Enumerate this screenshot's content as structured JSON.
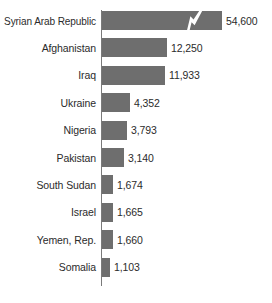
{
  "chart_data": {
    "type": "bar",
    "orientation": "horizontal",
    "title": "",
    "subtitle": "",
    "xlabel": "",
    "ylabel": "",
    "grid": false,
    "legend": null,
    "axis_break": {
      "present": true,
      "series_index": 0,
      "note": "zig-zag break mark on the Syrian Arab Republic bar indicating a truncated scale"
    },
    "bar_color": "#6e6e6e",
    "axis_color": "#7a7a7a",
    "text_color": "#2b2b2b",
    "background_color": "#ffffff",
    "categories": [
      "Syrian Arab Republic",
      "Afghanistan",
      "Iraq",
      "Ukraine",
      "Nigeria",
      "Pakistan",
      "South Sudan",
      "Israel",
      "Yemen, Rep.",
      "Somalia"
    ],
    "values": [
      54600,
      12250,
      11933,
      4352,
      3793,
      3140,
      1674,
      1665,
      1660,
      1103
    ],
    "value_labels": [
      "54,600",
      "12,250",
      "11,933",
      "4,352",
      "3,793",
      "3,140",
      "1,674",
      "1,665",
      "1,660",
      "1,103"
    ],
    "bar_pixel_lengths": [
      120,
      65,
      63,
      28,
      25,
      22,
      11,
      11,
      11,
      8
    ]
  },
  "rows": [
    {
      "label": "Syrian Arab Republic",
      "value_label": "54,600",
      "bar_px": 120,
      "break": true
    },
    {
      "label": "Afghanistan",
      "value_label": "12,250",
      "bar_px": 65,
      "break": false
    },
    {
      "label": "Iraq",
      "value_label": "11,933",
      "bar_px": 63,
      "break": false
    },
    {
      "label": "Ukraine",
      "value_label": "4,352",
      "bar_px": 28,
      "break": false
    },
    {
      "label": "Nigeria",
      "value_label": "3,793",
      "bar_px": 25,
      "break": false
    },
    {
      "label": "Pakistan",
      "value_label": "3,140",
      "bar_px": 22,
      "break": false
    },
    {
      "label": "South Sudan",
      "value_label": "1,674",
      "bar_px": 11,
      "break": false
    },
    {
      "label": "Israel",
      "value_label": "1,665",
      "bar_px": 11,
      "break": false
    },
    {
      "label": "Yemen, Rep.",
      "value_label": "1,660",
      "bar_px": 11,
      "break": false
    },
    {
      "label": "Somalia",
      "value_label": "1,103",
      "bar_px": 8,
      "break": false
    }
  ]
}
